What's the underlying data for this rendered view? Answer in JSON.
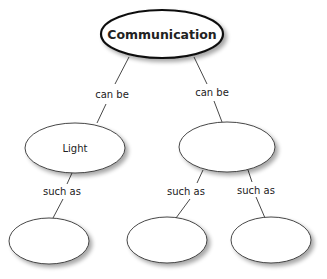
{
  "diagram": {
    "root": {
      "label": "Communication"
    },
    "level1": [
      {
        "label": "Light",
        "link_label": "can be"
      },
      {
        "label": "",
        "link_label": "can be"
      }
    ],
    "level2": [
      {
        "label": "",
        "link_label": "such as"
      },
      {
        "label": "",
        "link_label": "such as"
      },
      {
        "label": "",
        "link_label": "such as"
      }
    ]
  }
}
